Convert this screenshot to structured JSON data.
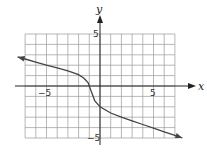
{
  "chart_data": {
    "type": "line",
    "title": "",
    "xlabel": "x",
    "ylabel": "y",
    "xlim": [
      -7,
      7
    ],
    "ylim": [
      -5,
      5
    ],
    "grid": true,
    "tick_labels": {
      "x": [
        "-5",
        "5"
      ],
      "y": [
        "5",
        "-5"
      ]
    },
    "series": [
      {
        "name": "curve",
        "x": [
          -7.7,
          -7,
          -6,
          -5,
          -4,
          -3,
          -2,
          -1.5,
          -1.1,
          -1,
          -0.9,
          -0.5,
          0,
          1,
          2,
          3,
          4,
          5,
          6,
          7,
          7.7
        ],
        "y": [
          2.8,
          2.6,
          2.3,
          2.0,
          1.75,
          1.45,
          1.1,
          0.75,
          0.3,
          0,
          -0.3,
          -1.4,
          -2.0,
          -2.6,
          -3.0,
          -3.35,
          -3.7,
          -4.05,
          -4.4,
          -4.75,
          -5.0
        ]
      }
    ]
  },
  "labels": {
    "x_axis": "x",
    "y_axis": "y",
    "x_neg": "−5",
    "x_pos": "5",
    "y_pos": "5",
    "y_neg": "−5"
  }
}
